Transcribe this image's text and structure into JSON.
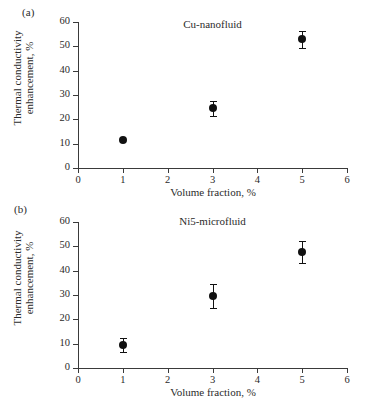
{
  "figure": {
    "panels": [
      {
        "label": "(a)",
        "title": "Cu-nanofluid"
      },
      {
        "label": "(b)",
        "title": "Ni5-microfluid"
      }
    ],
    "axis": {
      "xlabel": "Volume fraction, %",
      "ylabel_line1": "Thermal conductivity",
      "ylabel_line2": "enhancement, %",
      "xticks": [
        "0",
        "1",
        "2",
        "3",
        "4",
        "5",
        "6"
      ],
      "yticks": [
        "0",
        "10",
        "20",
        "30",
        "40",
        "50",
        "60"
      ]
    },
    "colors": {
      "marker": "#111111",
      "axis": "#3a3a3a",
      "text": "#2b2b2b",
      "background": "#ffffff"
    }
  },
  "chart_data": [
    {
      "type": "scatter",
      "title": "Cu-nanofluid",
      "panel": "(a)",
      "xlabel": "Volume fraction, %",
      "ylabel": "Thermal conductivity enhancement, %",
      "xlim": [
        0,
        6
      ],
      "ylim": [
        0,
        60
      ],
      "xticks": [
        0,
        1,
        2,
        3,
        4,
        5,
        6
      ],
      "yticks": [
        0,
        10,
        20,
        30,
        40,
        50,
        60
      ],
      "grid": false,
      "legend": "none",
      "x": [
        1,
        3,
        5
      ],
      "values": [
        11.5,
        24.5,
        53.0
      ],
      "yerr": [
        0.0,
        3.0,
        3.5
      ]
    },
    {
      "type": "scatter",
      "title": "Ni5-microfluid",
      "panel": "(b)",
      "xlabel": "Volume fraction, %",
      "ylabel": "Thermal conductivity enhancement, %",
      "xlim": [
        0,
        6
      ],
      "ylim": [
        0,
        60
      ],
      "xticks": [
        0,
        1,
        2,
        3,
        4,
        5,
        6
      ],
      "yticks": [
        0,
        10,
        20,
        30,
        40,
        50,
        60
      ],
      "grid": false,
      "legend": "none",
      "x": [
        1,
        3,
        5
      ],
      "values": [
        9.5,
        29.5,
        47.5
      ],
      "yerr": [
        3.0,
        5.0,
        4.5
      ]
    }
  ]
}
